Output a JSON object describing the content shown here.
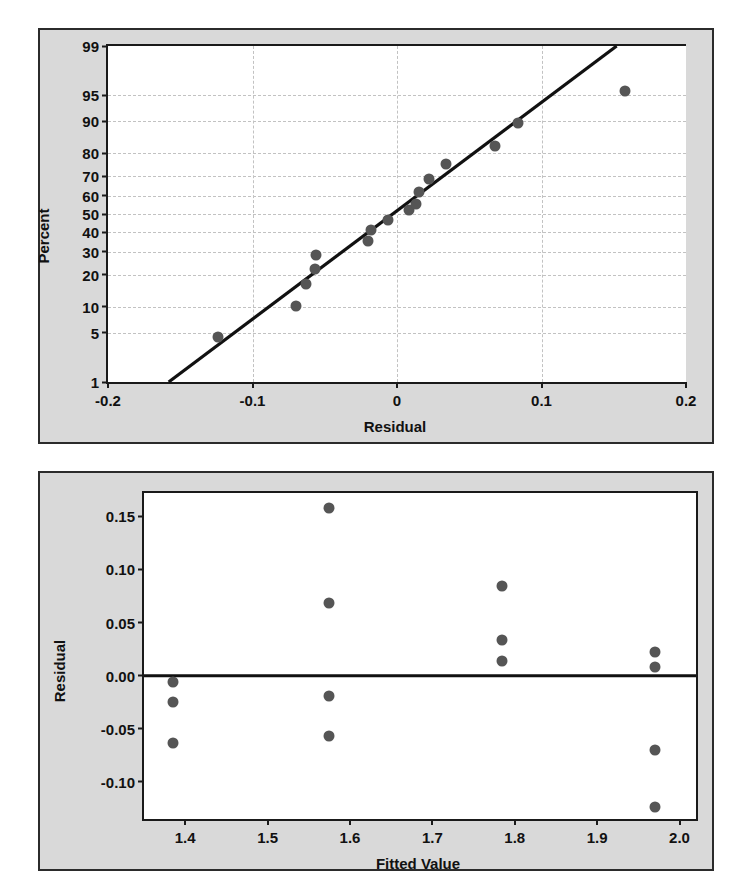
{
  "figure": {
    "background_color": "#d9d9d9",
    "plot_background_color": "#ffffff",
    "marker_color": "#555555",
    "line_color": "#111111",
    "grid_color": "#c2c2c2"
  },
  "chart_data": [
    {
      "type": "scatter",
      "name": "normal-probability-plot-of-residuals",
      "title": "",
      "xlabel": "Residual",
      "ylabel": "Percent",
      "xlim": [
        -0.2,
        0.2
      ],
      "xticks": [
        -0.2,
        -0.1,
        0,
        0.1,
        0.2
      ],
      "xticklabels": [
        "-0.2",
        "-0.1",
        "0",
        "0.1",
        "0.2"
      ],
      "yscale": "normal-probability",
      "yticks": [
        1,
        5,
        10,
        20,
        30,
        40,
        50,
        60,
        70,
        80,
        90,
        95,
        99
      ],
      "yticklabels": [
        "1",
        "5",
        "10",
        "20",
        "30",
        "40",
        "50",
        "60",
        "70",
        "80",
        "90",
        "95",
        "99"
      ],
      "grid": true,
      "legend": "none",
      "x": [
        -0.124,
        -0.07,
        -0.063,
        -0.057,
        -0.056,
        -0.02,
        -0.018,
        -0.006,
        0.008,
        0.013,
        0.015,
        0.022,
        0.034,
        0.068,
        0.084,
        0.158
      ],
      "y": [
        4.5,
        10.2,
        16.5,
        22.5,
        28.5,
        35.5,
        41.0,
        46.5,
        52.0,
        55.5,
        62.0,
        68.5,
        75.5,
        82.5,
        89.5,
        95.5
      ],
      "fit_line": {
        "label": "reference-line",
        "x_start": -0.158,
        "y_start": 1,
        "x_end": 0.152,
        "y_end": 99
      }
    },
    {
      "type": "scatter",
      "name": "residuals-versus-fitted-values",
      "title": "",
      "xlabel": "Fitted Value",
      "ylabel": "Residual",
      "xlim": [
        1.35,
        2.02
      ],
      "xticks": [
        1.4,
        1.5,
        1.6,
        1.7,
        1.8,
        1.9,
        2.0
      ],
      "xticklabels": [
        "1.4",
        "1.5",
        "1.6",
        "1.7",
        "1.8",
        "1.9",
        "2.0"
      ],
      "ylim": [
        -0.135,
        0.172
      ],
      "yticks": [
        0.15,
        0.1,
        0.05,
        0.0,
        -0.05,
        -0.1
      ],
      "yticklabels": [
        "0.15",
        "0.10",
        "0.05",
        "0.00",
        "-0.05",
        "-0.10"
      ],
      "grid": false,
      "legend": "none",
      "reference_line": {
        "label": "zero-line",
        "y": 0.0
      },
      "points": [
        {
          "x": 1.385,
          "y": -0.006
        },
        {
          "x": 1.385,
          "y": -0.025
        },
        {
          "x": 1.385,
          "y": -0.063
        },
        {
          "x": 1.575,
          "y": 0.158
        },
        {
          "x": 1.575,
          "y": 0.068
        },
        {
          "x": 1.575,
          "y": -0.019
        },
        {
          "x": 1.575,
          "y": -0.057
        },
        {
          "x": 1.785,
          "y": 0.084
        },
        {
          "x": 1.785,
          "y": 0.034
        },
        {
          "x": 1.785,
          "y": 0.014
        },
        {
          "x": 1.97,
          "y": 0.022
        },
        {
          "x": 1.97,
          "y": 0.008
        },
        {
          "x": 1.97,
          "y": -0.07
        },
        {
          "x": 1.97,
          "y": -0.124
        }
      ]
    }
  ]
}
